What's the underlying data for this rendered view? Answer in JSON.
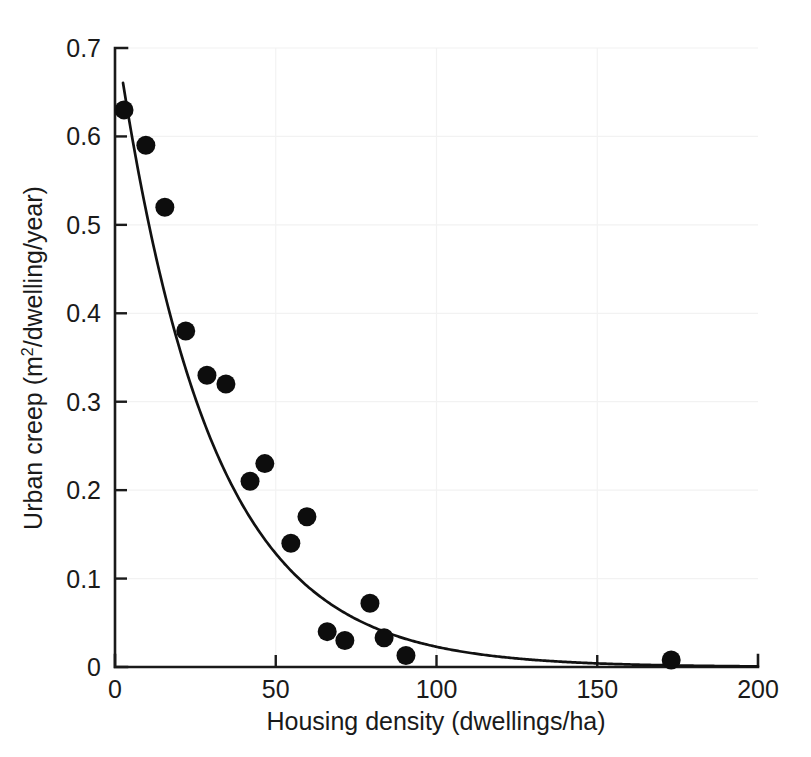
{
  "chart_data": {
    "type": "scatter",
    "title": "",
    "xlabel": "Housing density (dwellings/ha)",
    "ylabel": "Urban creep (m²/dwelling/year)",
    "ylabel_main": "Urban creep (m",
    "ylabel_sup": "2",
    "ylabel_tail": "/dwelling/year)",
    "xlim": [
      0,
      200
    ],
    "ylim": [
      0,
      0.7
    ],
    "grid": true,
    "legend": "none",
    "xticks": [
      0,
      50,
      100,
      150,
      200
    ],
    "xtick_labels": [
      "0",
      "50",
      "100",
      "150",
      "200"
    ],
    "yticks": [
      0,
      0.1,
      0.2,
      0.3,
      0.4,
      0.5,
      0.6,
      0.7
    ],
    "ytick_labels": [
      "0",
      "0.1",
      "0.2",
      "0.3",
      "0.4",
      "0.5",
      "0.6",
      "0.7"
    ],
    "marker": "filled-circle",
    "marker_color": "#0d0d0d",
    "curve_color": "#111111",
    "series": [
      {
        "name": "Observed urban creep",
        "type": "scatter",
        "points": [
          {
            "x": 2.8,
            "y": 0.63
          },
          {
            "x": 9.6,
            "y": 0.59
          },
          {
            "x": 15.5,
            "y": 0.52
          },
          {
            "x": 22.0,
            "y": 0.38
          },
          {
            "x": 28.6,
            "y": 0.33
          },
          {
            "x": 34.5,
            "y": 0.32
          },
          {
            "x": 42.0,
            "y": 0.21
          },
          {
            "x": 46.6,
            "y": 0.23
          },
          {
            "x": 54.7,
            "y": 0.14
          },
          {
            "x": 59.7,
            "y": 0.17
          },
          {
            "x": 66.0,
            "y": 0.04
          },
          {
            "x": 71.5,
            "y": 0.03
          },
          {
            "x": 79.3,
            "y": 0.072
          },
          {
            "x": 83.7,
            "y": 0.033
          },
          {
            "x": 90.5,
            "y": 0.013
          },
          {
            "x": 173.0,
            "y": 0.008
          }
        ]
      },
      {
        "name": "Fitted exponential decay curve",
        "type": "line",
        "model": "y = 0.72 * exp(-0.0345 * x)",
        "amplitude": 0.72,
        "decay_rate": 0.0345,
        "x_start": 2.5,
        "x_end": 200,
        "points": [
          {
            "x": 2.5,
            "y": 0.677
          },
          {
            "x": 5,
            "y": 0.606
          },
          {
            "x": 10,
            "y": 0.51
          },
          {
            "x": 15,
            "y": 0.43
          },
          {
            "x": 20,
            "y": 0.361
          },
          {
            "x": 25,
            "y": 0.304
          },
          {
            "x": 30,
            "y": 0.256
          },
          {
            "x": 35,
            "y": 0.215
          },
          {
            "x": 40,
            "y": 0.181
          },
          {
            "x": 45,
            "y": 0.152
          },
          {
            "x": 50,
            "y": 0.128
          },
          {
            "x": 60,
            "y": 0.091
          },
          {
            "x": 70,
            "y": 0.064
          },
          {
            "x": 80,
            "y": 0.045
          },
          {
            "x": 90,
            "y": 0.032
          },
          {
            "x": 100,
            "y": 0.023
          },
          {
            "x": 120,
            "y": 0.011
          },
          {
            "x": 140,
            "y": 0.006
          },
          {
            "x": 160,
            "y": 0.003
          },
          {
            "x": 180,
            "y": 0.0014
          },
          {
            "x": 200,
            "y": 0.0007
          }
        ]
      }
    ]
  }
}
